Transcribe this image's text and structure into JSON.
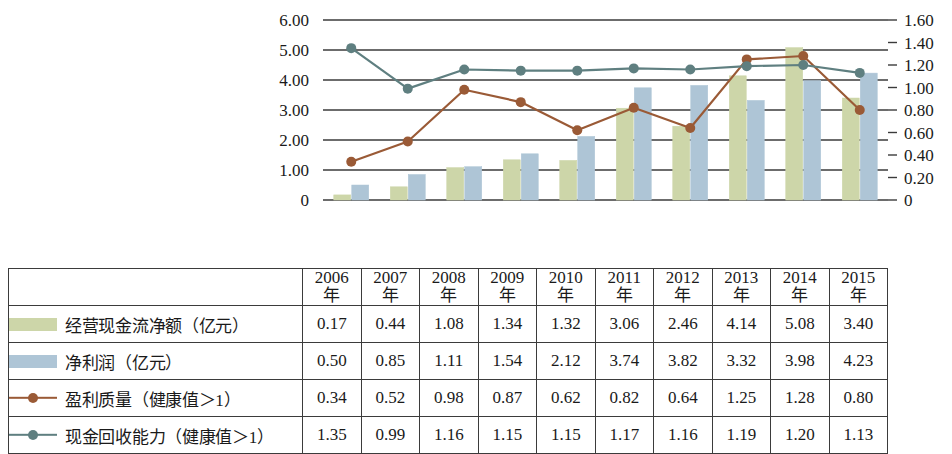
{
  "chart_data": {
    "type": "bar",
    "title": "",
    "subtitle": "",
    "xlabel": "",
    "ylabel": "",
    "grid": true,
    "legend_position": "table-below",
    "categories": [
      "2006年",
      "2007年",
      "2008年",
      "2009年",
      "2010年",
      "2011年",
      "2012年",
      "2013年",
      "2014年",
      "2015年"
    ],
    "category_numbers": [
      "2006",
      "2007",
      "2008",
      "2009",
      "2010",
      "2011",
      "2012",
      "2013",
      "2014",
      "2015"
    ],
    "category_unit": "年",
    "left_axis": {
      "ticks": [
        "0",
        "1.00",
        "2.00",
        "3.00",
        "4.00",
        "5.00",
        "6.00"
      ],
      "values": [
        0,
        1,
        2,
        3,
        4,
        5,
        6
      ],
      "min": 0,
      "max": 6,
      "step": 1
    },
    "right_axis": {
      "ticks": [
        "0",
        "0.20",
        "0.40",
        "0.60",
        "0.80",
        "1.00",
        "1.20",
        "1.40",
        "1.60"
      ],
      "values": [
        0,
        0.2,
        0.4,
        0.6,
        0.8,
        1.0,
        1.2,
        1.4,
        1.6
      ],
      "min": 0,
      "max": 1.6,
      "step": 0.2
    },
    "series": [
      {
        "name": "经营现金流净额（亿元）",
        "kind": "bar",
        "axis": "left",
        "color": "#cdd6a9",
        "values": [
          0.17,
          0.44,
          1.08,
          1.34,
          1.32,
          3.06,
          2.46,
          4.14,
          5.08,
          3.4
        ]
      },
      {
        "name": "净利润（亿元）",
        "kind": "bar",
        "axis": "left",
        "color": "#aec5d6",
        "values": [
          0.5,
          0.85,
          1.11,
          1.54,
          2.12,
          3.74,
          3.82,
          3.32,
          3.98,
          4.23
        ]
      },
      {
        "name": "盈利质量（健康值＞1）",
        "kind": "line",
        "axis": "right",
        "color": "#9a5a36",
        "values": [
          0.34,
          0.52,
          0.98,
          0.87,
          0.62,
          0.82,
          0.64,
          1.25,
          1.28,
          0.8
        ]
      },
      {
        "name": "现金回收能力（健康值＞1）",
        "kind": "line",
        "axis": "right",
        "color": "#5f7f80",
        "values": [
          1.35,
          0.99,
          1.16,
          1.15,
          1.15,
          1.17,
          1.16,
          1.19,
          1.2,
          1.13
        ]
      }
    ]
  },
  "colors": {
    "bar_green": "#cdd6a9",
    "bar_blue": "#aec5d6",
    "line_brown": "#9a5a36",
    "line_teal": "#5f7f80",
    "gridline": "#3b3b3b",
    "table_border": "#3b3b3b"
  }
}
